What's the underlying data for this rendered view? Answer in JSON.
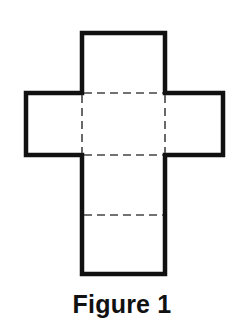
{
  "caption": "Figure 1",
  "colors": {
    "outline": "#111111",
    "fold_line": "#444444",
    "background": "#ffffff"
  },
  "diagram": {
    "type": "net-of-cube-cross",
    "faces": [
      {
        "id": "top",
        "x": 82,
        "y": 33,
        "w": 83,
        "h": 60
      },
      {
        "id": "left",
        "x": 26,
        "y": 93,
        "w": 56,
        "h": 62
      },
      {
        "id": "center",
        "x": 82,
        "y": 93,
        "w": 83,
        "h": 62
      },
      {
        "id": "right",
        "x": 165,
        "y": 93,
        "w": 58,
        "h": 62
      },
      {
        "id": "lower",
        "x": 82,
        "y": 155,
        "w": 83,
        "h": 60
      },
      {
        "id": "bottom",
        "x": 82,
        "y": 215,
        "w": 83,
        "h": 59
      }
    ],
    "fold_lines": [
      {
        "x1": 82,
        "y1": 93,
        "x2": 165,
        "y2": 93
      },
      {
        "x1": 82,
        "y1": 155,
        "x2": 165,
        "y2": 155
      },
      {
        "x1": 82,
        "y1": 215,
        "x2": 165,
        "y2": 215
      },
      {
        "x1": 82,
        "y1": 93,
        "x2": 82,
        "y2": 155
      },
      {
        "x1": 165,
        "y1": 93,
        "x2": 165,
        "y2": 155
      }
    ]
  }
}
